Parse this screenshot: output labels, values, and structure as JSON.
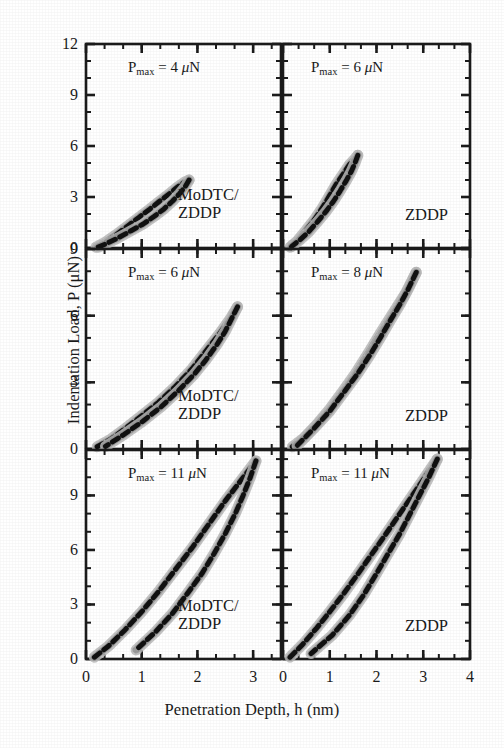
{
  "figure": {
    "xlabel": "Penetration Depth, h (nm)",
    "ylabel": "Indentation Load, P (μN)"
  },
  "chart_data": {
    "type": "line",
    "title": "",
    "xlabel": "Penetration Depth, h (nm)",
    "ylabel": "Indentation Load, P (μN)",
    "grid": false,
    "legend": "none",
    "layout": "3 rows x 2 columns of load-displacement (nanoindentation) panels; dashed black loading and unloading curves with light grey scatter band; ticks point inward; minor ticks between major ticks",
    "panels": [
      {
        "row": 1,
        "col": 1,
        "pmax_label": "P",
        "pmax_sub": "max",
        "pmax_value": "= 4 μN",
        "sample": "MoDTC/\nZDDP",
        "xlim": [
          0,
          3.5
        ],
        "ylim": [
          0,
          12
        ],
        "xticks": [
          0,
          1,
          2,
          3
        ],
        "yticks": [
          0,
          3,
          6,
          9,
          12
        ],
        "xminor_per_interval": 2,
        "yminor_per_interval": 2,
        "loading": {
          "x": [
            0.18,
            0.35,
            0.55,
            0.75,
            0.95,
            1.15,
            1.32,
            1.5,
            1.65,
            1.78,
            1.85
          ],
          "y": [
            0.05,
            0.35,
            0.8,
            1.3,
            1.8,
            2.3,
            2.75,
            3.2,
            3.6,
            3.9,
            4.0
          ]
        },
        "unloading": {
          "x": [
            1.85,
            1.78,
            1.68,
            1.55,
            1.4,
            1.22,
            1.02,
            0.8,
            0.58,
            0.38,
            0.22
          ],
          "y": [
            4.0,
            3.6,
            3.2,
            2.75,
            2.3,
            1.85,
            1.4,
            1.0,
            0.6,
            0.28,
            0.05
          ]
        }
      },
      {
        "row": 1,
        "col": 2,
        "pmax_label": "P",
        "pmax_sub": "max",
        "pmax_value": "= 6 μN",
        "sample": "ZDDP",
        "xlim": [
          0,
          4
        ],
        "ylim": [
          0,
          12
        ],
        "xticks": [
          0,
          1,
          2,
          3,
          4
        ],
        "yticks": [
          0,
          3,
          6,
          9,
          12
        ],
        "xminor_per_interval": 2,
        "yminor_per_interval": 2,
        "loading": {
          "x": [
            0.15,
            0.3,
            0.48,
            0.68,
            0.85,
            1.0,
            1.15,
            1.3,
            1.42,
            1.52,
            1.6
          ],
          "y": [
            0.05,
            0.4,
            1.0,
            1.7,
            2.4,
            3.1,
            3.8,
            4.4,
            4.9,
            5.2,
            5.45
          ]
        },
        "unloading": {
          "x": [
            1.6,
            1.54,
            1.46,
            1.35,
            1.22,
            1.08,
            0.92,
            0.74,
            0.55,
            0.35,
            0.18
          ],
          "y": [
            5.45,
            5.0,
            4.5,
            3.95,
            3.35,
            2.75,
            2.15,
            1.55,
            0.95,
            0.45,
            0.08
          ]
        }
      },
      {
        "row": 2,
        "col": 1,
        "pmax_label": "P",
        "pmax_sub": "max",
        "pmax_value": "= 6 μN",
        "sample": "MoDTC/\nZDDP",
        "xlim": [
          0,
          3.5
        ],
        "ylim": [
          0,
          9
        ],
        "xticks": [
          0,
          1,
          2,
          3
        ],
        "yticks": [
          0,
          3,
          6,
          9
        ],
        "xminor_per_interval": 2,
        "yminor_per_interval": 2,
        "loading": {
          "x": [
            0.2,
            0.45,
            0.72,
            1.0,
            1.3,
            1.6,
            1.9,
            2.15,
            2.4,
            2.6,
            2.72
          ],
          "y": [
            0.1,
            0.45,
            0.95,
            1.5,
            2.1,
            2.8,
            3.6,
            4.4,
            5.2,
            5.9,
            6.4
          ]
        },
        "unloading": {
          "x": [
            2.72,
            2.62,
            2.5,
            2.35,
            2.15,
            1.92,
            1.65,
            1.35,
            1.02,
            0.68,
            0.35
          ],
          "y": [
            6.4,
            5.9,
            5.3,
            4.7,
            4.0,
            3.3,
            2.6,
            1.9,
            1.25,
            0.65,
            0.12
          ]
        }
      },
      {
        "row": 2,
        "col": 2,
        "pmax_label": "P",
        "pmax_sub": "max",
        "pmax_value": "= 8 μN",
        "sample": "ZDDP",
        "xlim": [
          0,
          4
        ],
        "ylim": [
          0,
          9
        ],
        "xticks": [
          0,
          1,
          2,
          3,
          4
        ],
        "yticks": [
          0,
          3,
          6,
          9
        ],
        "xminor_per_interval": 2,
        "yminor_per_interval": 2,
        "loading": {
          "x": [
            0.2,
            0.45,
            0.72,
            1.0,
            1.28,
            1.55,
            1.82,
            2.08,
            2.35,
            2.62,
            2.85
          ],
          "y": [
            0.1,
            0.5,
            1.1,
            1.8,
            2.6,
            3.4,
            4.3,
            5.2,
            6.1,
            7.0,
            7.95
          ]
        },
        "unloading": {
          "x": [
            2.85,
            2.68,
            2.5,
            2.3,
            2.08,
            1.85,
            1.6,
            1.32,
            1.0,
            0.65,
            0.3
          ],
          "y": [
            7.95,
            7.2,
            6.5,
            5.8,
            5.0,
            4.2,
            3.4,
            2.6,
            1.7,
            0.9,
            0.15
          ]
        }
      },
      {
        "row": 3,
        "col": 1,
        "pmax_label": "P",
        "pmax_sub": "max",
        "pmax_value": "= 11 μN",
        "sample": "MoDTC/\nZDDP",
        "xlim": [
          0,
          3.5
        ],
        "ylim": [
          0,
          11.5
        ],
        "xticks": [
          0,
          1,
          2,
          3
        ],
        "yticks": [
          0,
          3,
          6,
          9
        ],
        "xminor_per_interval": 2,
        "yminor_per_interval": 2,
        "loading": {
          "x": [
            0.15,
            0.4,
            0.7,
            1.0,
            1.3,
            1.6,
            1.9,
            2.2,
            2.5,
            2.8,
            3.05
          ],
          "y": [
            0.1,
            0.7,
            1.6,
            2.6,
            3.7,
            4.9,
            6.1,
            7.4,
            8.7,
            9.9,
            10.9
          ]
        },
        "unloading": {
          "x": [
            3.05,
            2.95,
            2.82,
            2.68,
            2.5,
            2.3,
            2.08,
            1.82,
            1.55,
            1.25,
            0.9
          ],
          "y": [
            10.9,
            10.0,
            9.0,
            8.0,
            6.9,
            5.8,
            4.7,
            3.6,
            2.5,
            1.5,
            0.5
          ]
        }
      },
      {
        "row": 3,
        "col": 2,
        "pmax_label": "P",
        "pmax_sub": "max",
        "pmax_value": "= 11 μN",
        "sample": "ZDDP",
        "xlim": [
          0,
          4
        ],
        "ylim": [
          0,
          11.5
        ],
        "xticks": [
          0,
          1,
          2,
          3,
          4
        ],
        "yticks": [
          0,
          3,
          6,
          9
        ],
        "xminor_per_interval": 2,
        "yminor_per_interval": 2,
        "loading": {
          "x": [
            0.15,
            0.42,
            0.72,
            1.0,
            1.3,
            1.58,
            1.88,
            2.18,
            2.5,
            2.85,
            3.3
          ],
          "y": [
            0.1,
            0.8,
            1.7,
            2.6,
            3.6,
            4.6,
            5.7,
            6.8,
            8.0,
            9.3,
            11.0
          ]
        },
        "unloading": {
          "x": [
            3.3,
            3.12,
            2.92,
            2.72,
            2.5,
            2.25,
            2.0,
            1.72,
            1.42,
            1.05,
            0.6
          ],
          "y": [
            11.0,
            10.0,
            9.0,
            8.0,
            6.9,
            5.8,
            4.7,
            3.5,
            2.4,
            1.3,
            0.3
          ]
        }
      }
    ]
  }
}
